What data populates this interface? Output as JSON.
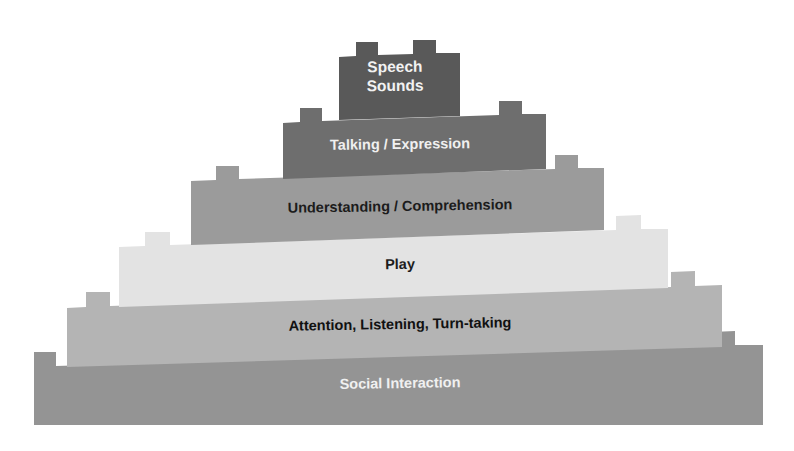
{
  "diagram": {
    "type": "layered-pyramid",
    "style": "lego-brick",
    "background_color": "#ffffff",
    "layers": [
      {
        "id": "speech-sounds",
        "level": 6,
        "label": "Speech\nSounds",
        "fill_color": "#595959",
        "text_color": "#f2f2f2",
        "studs": 2
      },
      {
        "id": "talking-expression",
        "level": 5,
        "label": "Talking / Expression",
        "fill_color": "#6e6e6e",
        "text_color": "#f0f0f0",
        "studs": 2
      },
      {
        "id": "understanding-comprehension",
        "level": 4,
        "label": "Understanding / Comprehension",
        "fill_color": "#9b9b9b",
        "text_color": "#1c1c1c",
        "studs": 2
      },
      {
        "id": "play",
        "level": 3,
        "label": "Play",
        "fill_color": "#e3e3e3",
        "text_color": "#1c1c1c",
        "studs": 2
      },
      {
        "id": "attention-listening-turn-taking",
        "level": 2,
        "label": "Attention, Listening, Turn-taking",
        "fill_color": "#b4b4b4",
        "text_color": "#111111",
        "studs": 2
      },
      {
        "id": "social-interaction",
        "level": 1,
        "label": "Social Interaction",
        "fill_color": "#949494",
        "text_color": "#f0f0f0",
        "studs": 2
      }
    ]
  }
}
